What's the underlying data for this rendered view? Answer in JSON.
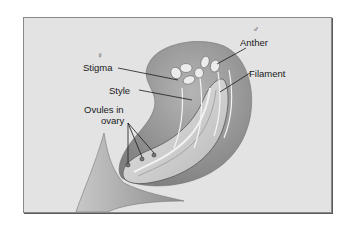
{
  "diagram": {
    "labels": {
      "female_symbol": "♀",
      "male_symbol": "♂",
      "stigma": "Stigma",
      "style": "Style",
      "ovules_line1": "Ovules in",
      "ovules_line2": "ovary",
      "anther": "Anther",
      "filament": "Filament"
    },
    "colors": {
      "background": "#e3e3e3",
      "petal_dark": "#8c8c8c",
      "petal_mid": "#a8a8a8",
      "ovary_light": "#d4d4d4",
      "leader_line": "#1a1a1a"
    }
  }
}
